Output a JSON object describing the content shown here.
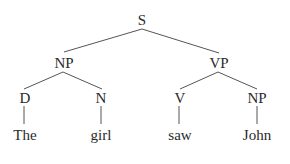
{
  "diagram": {
    "type": "syntax-tree",
    "nodes": {
      "s": {
        "label": "S",
        "x": 142,
        "y": 13
      },
      "np": {
        "label": "NP",
        "x": 64,
        "y": 56
      },
      "vp": {
        "label": "VP",
        "x": 219,
        "y": 56
      },
      "d": {
        "label": "D",
        "x": 25,
        "y": 91
      },
      "n": {
        "label": "N",
        "x": 101,
        "y": 91
      },
      "v": {
        "label": "V",
        "x": 180,
        "y": 91
      },
      "np2": {
        "label": "NP",
        "x": 257,
        "y": 91
      }
    },
    "leaves": {
      "the": {
        "label": "The",
        "x": 25,
        "y": 130
      },
      "girl": {
        "label": "girl",
        "x": 101,
        "y": 130
      },
      "saw": {
        "label": "saw",
        "x": 180,
        "y": 130
      },
      "john": {
        "label": "John",
        "x": 257,
        "y": 130
      }
    },
    "line_color": "#555555",
    "text_color": "#2a2a2a"
  }
}
